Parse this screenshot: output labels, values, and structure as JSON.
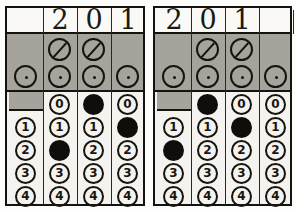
{
  "document": {
    "kind": "optical-mark-recognition-ballot",
    "title": "Scanned numeric entry field pair"
  },
  "symbols": {
    "slash_circle": "slash-circle-mark",
    "dot_circle": "dot-circle-mark",
    "filled_bubble": "filled-bubble",
    "empty_bubble": "empty-bubble"
  },
  "bubble_digits": [
    "0",
    "1",
    "2",
    "3",
    "4"
  ],
  "panels": [
    {
      "id": "left-panel",
      "name": "left-number-field",
      "handwritten_value": "201",
      "marked_value": "201",
      "alignment": "right",
      "columns": [
        {
          "index": 1,
          "handwritten": "",
          "has_slash_circle": false,
          "has_dot_circle": true,
          "has_zero_bubble": false,
          "digits": [
            "1",
            "2",
            "3",
            "4"
          ],
          "marked": null
        },
        {
          "index": 2,
          "handwritten": "2",
          "has_slash_circle": true,
          "has_dot_circle": true,
          "has_zero_bubble": true,
          "digits": [
            "0",
            "1",
            "2",
            "3",
            "4"
          ],
          "marked": "2"
        },
        {
          "index": 3,
          "handwritten": "0",
          "has_slash_circle": true,
          "has_dot_circle": true,
          "has_zero_bubble": true,
          "digits": [
            "0",
            "1",
            "2",
            "3",
            "4"
          ],
          "marked": "0"
        },
        {
          "index": 4,
          "handwritten": "1",
          "has_slash_circle": false,
          "has_dot_circle": true,
          "has_zero_bubble": true,
          "digits": [
            "0",
            "1",
            "2",
            "3",
            "4"
          ],
          "marked": "1"
        }
      ]
    },
    {
      "id": "right-panel",
      "name": "right-number-field",
      "handwritten_value": "201",
      "marked_value": "201",
      "alignment": "left",
      "columns": [
        {
          "index": 1,
          "handwritten": "2",
          "has_slash_circle": false,
          "has_dot_circle": true,
          "has_zero_bubble": false,
          "digits": [
            "1",
            "2",
            "3",
            "4"
          ],
          "marked": "2"
        },
        {
          "index": 2,
          "handwritten": "0",
          "has_slash_circle": true,
          "has_dot_circle": true,
          "has_zero_bubble": true,
          "digits": [
            "0",
            "1",
            "2",
            "3",
            "4"
          ],
          "marked": "0"
        },
        {
          "index": 3,
          "handwritten": "1",
          "has_slash_circle": true,
          "has_dot_circle": true,
          "has_zero_bubble": true,
          "digits": [
            "0",
            "1",
            "2",
            "3",
            "4"
          ],
          "marked": "1"
        },
        {
          "index": 4,
          "handwritten": "",
          "has_slash_circle": false,
          "has_dot_circle": true,
          "has_zero_bubble": true,
          "digits": [
            "0",
            "1",
            "2",
            "3",
            "4"
          ],
          "marked": null
        }
      ]
    }
  ],
  "colors": {
    "paper": "#f4f3ef",
    "ink": "#15130f",
    "gray_band": "#a5a39c",
    "fill": "#100e0a"
  }
}
